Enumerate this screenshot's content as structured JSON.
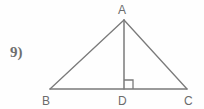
{
  "problem": {
    "number_label": "9)"
  },
  "figure": {
    "type": "geometry-diagram",
    "stroke_color": "#7a7a7a",
    "background_color": "#fefefe",
    "label_color": "#6b6b6b",
    "vertices": [
      {
        "id": "A",
        "label": "A",
        "x": 124,
        "y": 20,
        "label_x": 118,
        "label_y": 14
      },
      {
        "id": "B",
        "label": "B",
        "x": 50,
        "y": 89,
        "label_x": 42,
        "label_y": 105
      },
      {
        "id": "C",
        "label": "C",
        "x": 187,
        "y": 89,
        "label_x": 184,
        "label_y": 105
      },
      {
        "id": "D",
        "label": "D",
        "x": 124,
        "y": 89,
        "label_x": 118,
        "label_y": 105
      }
    ],
    "segments": [
      {
        "name": "AB",
        "from": "A",
        "to": "B"
      },
      {
        "name": "AC",
        "from": "A",
        "to": "C"
      },
      {
        "name": "BC",
        "from": "B",
        "to": "C"
      },
      {
        "name": "AD",
        "from": "A",
        "to": "D"
      }
    ],
    "right_angle": {
      "at_vertex": "D",
      "marker": "square",
      "size": 9,
      "direction": "right"
    }
  }
}
